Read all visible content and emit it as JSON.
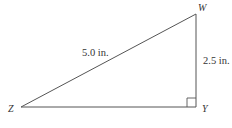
{
  "figure": {
    "type": "right-triangle",
    "vertices": {
      "W": {
        "label": "W",
        "x": 196,
        "y": 14
      },
      "Y": {
        "label": "Y",
        "x": 196,
        "y": 107
      },
      "Z": {
        "label": "Z",
        "x": 21,
        "y": 107
      }
    },
    "right_angle_at": "Y",
    "sides": {
      "ZW": {
        "label": "5.0 in.",
        "role": "hypotenuse"
      },
      "WY": {
        "label": "2.5 in.",
        "role": "leg"
      },
      "ZY": {
        "label": "",
        "role": "leg"
      }
    },
    "colors": {
      "line": "#555555",
      "text": "#333333",
      "background": "#ffffff"
    }
  }
}
